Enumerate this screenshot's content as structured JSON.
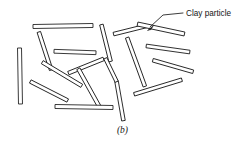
{
  "figure": {
    "caption": "(b)",
    "callout": {
      "label": "Clay particle",
      "label_x": 186,
      "label_y": 16,
      "leader_path": "M 183 13 L 163 15 L 150 27",
      "arrow_tip": [
        147.5,
        30.5
      ],
      "arrow_points": "147.5,30.5 153.5,25.5 151.0,29.5"
    },
    "style": {
      "background_color": "#ffffff",
      "ink_color": "#1a1a1a",
      "particle_fill": "#ffffff",
      "stroke_width": 0.85
    },
    "particles": [
      {
        "id": "particle-01",
        "cx": 63,
        "cy": 26,
        "length": 60,
        "thickness": 4.0,
        "angle": -1
      },
      {
        "id": "particle-02",
        "cx": 20,
        "cy": 76,
        "length": 56,
        "thickness": 4.0,
        "angle": 89
      },
      {
        "id": "particle-03",
        "cx": 45,
        "cy": 51,
        "length": 40,
        "thickness": 3.6,
        "angle": 72
      },
      {
        "id": "particle-04",
        "cx": 75,
        "cy": 52,
        "length": 42,
        "thickness": 3.8,
        "angle": 2
      },
      {
        "id": "particle-05",
        "cx": 106,
        "cy": 43,
        "length": 38,
        "thickness": 3.6,
        "angle": 76
      },
      {
        "id": "particle-06",
        "cx": 62,
        "cy": 74,
        "length": 46,
        "thickness": 3.6,
        "angle": 31
      },
      {
        "id": "particle-07",
        "cx": 86,
        "cy": 66,
        "length": 38,
        "thickness": 3.6,
        "angle": -22
      },
      {
        "id": "particle-08",
        "cx": 89,
        "cy": 88,
        "length": 44,
        "thickness": 3.6,
        "angle": 61
      },
      {
        "id": "particle-09",
        "cx": 49,
        "cy": 91,
        "length": 42,
        "thickness": 3.6,
        "angle": 27
      },
      {
        "id": "particle-10",
        "cx": 84,
        "cy": 107,
        "length": 58,
        "thickness": 4.0,
        "angle": 1
      },
      {
        "id": "particle-11",
        "cx": 120,
        "cy": 101,
        "length": 40,
        "thickness": 3.6,
        "angle": 80
      },
      {
        "id": "particle-12",
        "cx": 136,
        "cy": 62,
        "length": 52,
        "thickness": 3.6,
        "angle": 70
      },
      {
        "id": "particle-13",
        "cx": 130,
        "cy": 30,
        "length": 34,
        "thickness": 3.6,
        "angle": -14
      },
      {
        "id": "particle-14",
        "cx": 161,
        "cy": 29,
        "length": 48,
        "thickness": 4.0,
        "angle": 12
      },
      {
        "id": "particle-15",
        "cx": 168,
        "cy": 49,
        "length": 44,
        "thickness": 3.6,
        "angle": 8
      },
      {
        "id": "particle-16",
        "cx": 173,
        "cy": 66,
        "length": 42,
        "thickness": 3.6,
        "angle": 16
      },
      {
        "id": "particle-17",
        "cx": 158,
        "cy": 87,
        "length": 50,
        "thickness": 3.6,
        "angle": -17
      },
      {
        "id": "particle-18",
        "cx": 111,
        "cy": 70,
        "length": 26,
        "thickness": 3.4,
        "angle": 64
      }
    ]
  }
}
